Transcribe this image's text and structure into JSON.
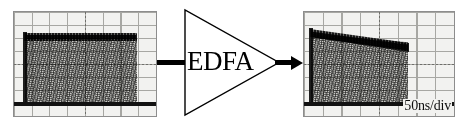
{
  "figure": {
    "background_color": "#ffffff"
  },
  "amplifier": {
    "label": "EDFA",
    "symbol": "triangle",
    "input_port_name": "input-lead",
    "output_port_name": "output-arrow",
    "line_color": "#000000"
  },
  "scopes": [
    {
      "id": "input-scope",
      "position": "left",
      "grid_divisions_x": 8,
      "grid_divisions_y": 8,
      "grid_color": "#9a9a96",
      "screen_color": "#f2f2f0",
      "trace_color": "#1a1a1a",
      "timebase_label": "",
      "trace_shape": "flat-top-pulse",
      "pulse_start_div": 0.55,
      "pulse_end_div": 7.1,
      "top_level_div_left": 6.45,
      "top_level_div_right": 6.45,
      "baseline_div": 0.65
    },
    {
      "id": "output-scope",
      "position": "right",
      "grid_divisions_x": 8,
      "grid_divisions_y": 8,
      "grid_color": "#9a9a96",
      "screen_color": "#f2f2f0",
      "trace_color": "#1a1a1a",
      "timebase_label": "50ns/div",
      "trace_shape": "drooping-top-pulse",
      "pulse_start_div": 0.35,
      "pulse_end_div": 6.4,
      "top_level_div_left": 6.6,
      "top_level_div_right": 5.5,
      "baseline_div": 0.65
    }
  ]
}
